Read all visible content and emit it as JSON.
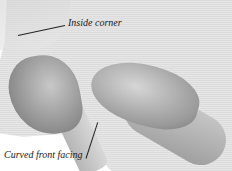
{
  "image": {
    "description": "Grayscale sewing instruction photograph: two hands folding fabric along a curved front facing",
    "labels": [
      {
        "id": "inside-corner",
        "text": "Inside corner"
      },
      {
        "id": "curved-front-facing",
        "text": "Curved front facing"
      }
    ]
  }
}
